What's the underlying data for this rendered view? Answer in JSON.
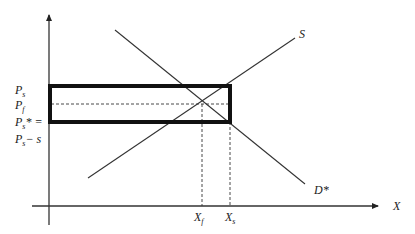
{
  "diagram": {
    "type": "supply-demand",
    "axes": {
      "x_label": "X",
      "y_label": ""
    },
    "curves": {
      "supply_label": "S",
      "demand_label": "D*"
    },
    "y_labels": {
      "ps": {
        "main": "P",
        "sub": "s"
      },
      "pf": {
        "main": "P",
        "sub": "f"
      },
      "ps_star": {
        "main": "P",
        "sub": "s",
        "suffix": "* ="
      },
      "ps_minus_s": {
        "main": "P",
        "sub": "s",
        "suffix": "− s"
      }
    },
    "x_labels": {
      "xf": {
        "main": "X",
        "sub": "f"
      },
      "xs": {
        "main": "X",
        "sub": "s"
      }
    },
    "colors": {
      "line": "#333333",
      "rect": "#111111"
    }
  }
}
